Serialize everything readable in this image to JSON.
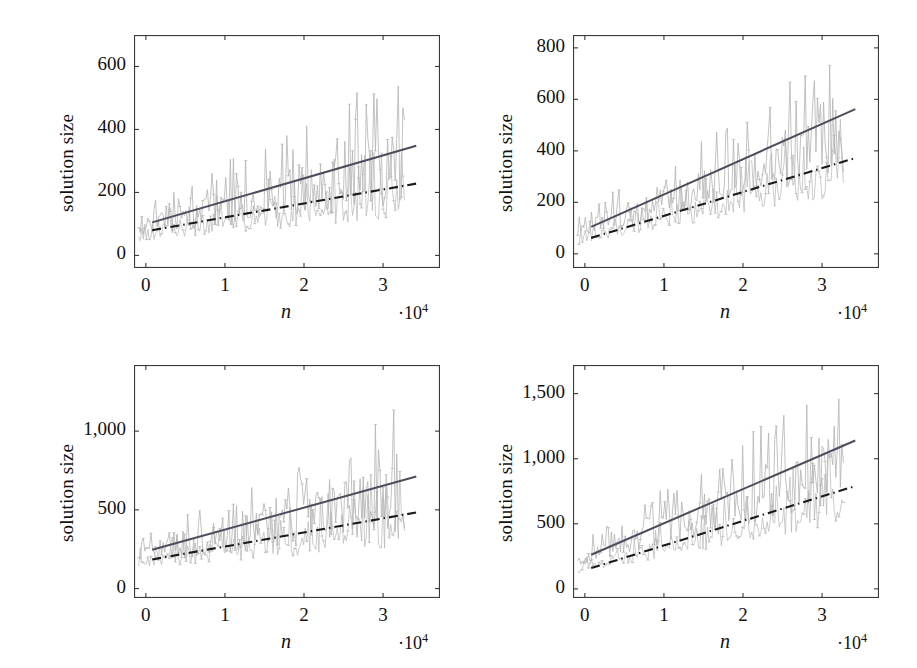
{
  "figure": {
    "background_color": "#ffffff",
    "panel_count": 4
  },
  "style": {
    "data_color": "#b3b3b3",
    "trend_solid_color": "#4d4d5c",
    "trend_dashdot_color": "#1a1a1a",
    "axis_color": "#3a3a3a",
    "text_color": "#111111"
  },
  "chart_data": [
    {
      "id": "panel-top-left",
      "type": "line",
      "title": "",
      "xlabel": "n",
      "xlabel_exponent": "·10",
      "xlabel_exponent_power": "4",
      "ylabel": "solution size",
      "xticks": [
        0,
        1,
        2,
        3
      ],
      "xtick_labels": [
        "0",
        "1",
        "2",
        "3"
      ],
      "yticks": [
        0,
        200,
        400,
        600
      ],
      "ytick_labels": [
        "0",
        "200",
        "400",
        "600"
      ],
      "xlim": [
        -0.15,
        3.72
      ],
      "ylim": [
        -40,
        700
      ],
      "grid": false,
      "legend": "none",
      "series": [
        {
          "name": "upper-trend-solid",
          "style": "solid",
          "color": "#4d4d5c",
          "x": [
            0.08,
            3.42
          ],
          "values": [
            105,
            348
          ]
        },
        {
          "name": "lower-trend-dashdot",
          "style": "dashdot",
          "color": "#1a1a1a",
          "x": [
            0.08,
            3.42
          ],
          "values": [
            80,
            228
          ]
        },
        {
          "name": "noisy-upper-samples",
          "style": "noisy",
          "color": "#b3b3b3",
          "mean_at_xmin": 95,
          "mean_at_xmax": 300,
          "noise_amplitude_min": 45,
          "noise_amplitude_max": 210,
          "seed": 11,
          "n_points": 175
        },
        {
          "name": "noisy-lower-samples",
          "style": "noisy",
          "color": "#b3b3b3",
          "mean_at_xmin": 70,
          "mean_at_xmax": 205,
          "noise_amplitude_min": 35,
          "noise_amplitude_max": 125,
          "seed": 29,
          "n_points": 175
        }
      ]
    },
    {
      "id": "panel-top-right",
      "type": "line",
      "title": "",
      "xlabel": "n",
      "xlabel_exponent": "·10",
      "xlabel_exponent_power": "4",
      "ylabel": "solution size",
      "xticks": [
        0,
        1,
        2,
        3
      ],
      "xtick_labels": [
        "0",
        "1",
        "2",
        "3"
      ],
      "yticks": [
        0,
        200,
        400,
        600,
        800
      ],
      "ytick_labels": [
        "0",
        "200",
        "400",
        "600",
        "800"
      ],
      "xlim": [
        -0.15,
        3.72
      ],
      "ylim": [
        -55,
        850
      ],
      "grid": false,
      "legend": "none",
      "series": [
        {
          "name": "upper-trend-solid",
          "style": "solid",
          "color": "#4d4d5c",
          "x": [
            0.08,
            3.42
          ],
          "values": [
            105,
            562
          ]
        },
        {
          "name": "lower-trend-dashdot",
          "style": "dashdot",
          "color": "#1a1a1a",
          "x": [
            0.08,
            3.42
          ],
          "values": [
            62,
            372
          ]
        },
        {
          "name": "noisy-upper-samples",
          "style": "noisy",
          "color": "#b3b3b3",
          "mean_at_xmin": 95,
          "mean_at_xmax": 470,
          "noise_amplitude_min": 45,
          "noise_amplitude_max": 235,
          "seed": 47,
          "n_points": 175
        },
        {
          "name": "noisy-lower-samples",
          "style": "noisy",
          "color": "#b3b3b3",
          "mean_at_xmin": 60,
          "mean_at_xmax": 330,
          "noise_amplitude_min": 35,
          "noise_amplitude_max": 150,
          "seed": 63,
          "n_points": 175
        }
      ]
    },
    {
      "id": "panel-bottom-left",
      "type": "line",
      "title": "",
      "xlabel": "n",
      "xlabel_exponent": "·10",
      "xlabel_exponent_power": "4",
      "ylabel": "solution size",
      "xticks": [
        0,
        1,
        2,
        3
      ],
      "xtick_labels": [
        "0",
        "1",
        "2",
        "3"
      ],
      "yticks": [
        0,
        500,
        1000
      ],
      "ytick_labels": [
        "0",
        "500",
        "1,000"
      ],
      "xlim": [
        -0.15,
        3.72
      ],
      "ylim": [
        -60,
        1420
      ],
      "grid": false,
      "legend": "none",
      "series": [
        {
          "name": "upper-trend-solid",
          "style": "solid",
          "color": "#4d4d5c",
          "x": [
            0.08,
            3.42
          ],
          "values": [
            246,
            712
          ]
        },
        {
          "name": "lower-trend-dashdot",
          "style": "dashdot",
          "color": "#1a1a1a",
          "x": [
            0.08,
            3.42
          ],
          "values": [
            185,
            483
          ]
        },
        {
          "name": "noisy-upper-samples",
          "style": "noisy",
          "color": "#b3b3b3",
          "mean_at_xmin": 215,
          "mean_at_xmax": 620,
          "noise_amplitude_min": 80,
          "noise_amplitude_max": 400,
          "seed": 83,
          "n_points": 175
        },
        {
          "name": "noisy-lower-samples",
          "style": "noisy",
          "color": "#b3b3b3",
          "mean_at_xmin": 170,
          "mean_at_xmax": 440,
          "noise_amplitude_min": 65,
          "noise_amplitude_max": 255,
          "seed": 97,
          "n_points": 175
        }
      ]
    },
    {
      "id": "panel-bottom-right",
      "type": "line",
      "title": "",
      "xlabel": "n",
      "xlabel_exponent": "·10",
      "xlabel_exponent_power": "4",
      "ylabel": "solution size",
      "xticks": [
        0,
        1,
        2,
        3
      ],
      "xtick_labels": [
        "0",
        "1",
        "2",
        "3"
      ],
      "yticks": [
        0,
        500,
        1000,
        1500
      ],
      "ytick_labels": [
        "0",
        "500",
        "1,000",
        "1,500"
      ],
      "xlim": [
        -0.15,
        3.72
      ],
      "ylim": [
        -70,
        1720
      ],
      "grid": false,
      "legend": "none",
      "series": [
        {
          "name": "upper-trend-solid",
          "style": "solid",
          "color": "#4d4d5c",
          "x": [
            0.08,
            3.42
          ],
          "values": [
            262,
            1140
          ]
        },
        {
          "name": "lower-trend-dashdot",
          "style": "dashdot",
          "color": "#1a1a1a",
          "x": [
            0.08,
            3.42
          ],
          "values": [
            160,
            790
          ]
        },
        {
          "name": "noisy-upper-samples",
          "style": "noisy",
          "color": "#b3b3b3",
          "mean_at_xmin": 225,
          "mean_at_xmax": 1010,
          "noise_amplitude_min": 85,
          "noise_amplitude_max": 480,
          "seed": 131,
          "n_points": 175
        },
        {
          "name": "noisy-lower-samples",
          "style": "noisy",
          "color": "#b3b3b3",
          "mean_at_xmin": 150,
          "mean_at_xmax": 700,
          "noise_amplitude_min": 60,
          "noise_amplitude_max": 300,
          "seed": 157,
          "n_points": 175
        }
      ]
    }
  ],
  "panels": [
    {
      "name": "panel-top-left",
      "left": 134,
      "top": 35,
      "width": 306,
      "height": 233,
      "ylabel_text": "solution size",
      "xlabel_text": "n",
      "exp_text_prefix": "·10",
      "exp_text_power": "4"
    },
    {
      "name": "panel-top-right",
      "left": 573,
      "top": 35,
      "width": 306,
      "height": 233,
      "ylabel_text": "solution size",
      "xlabel_text": "n",
      "exp_text_prefix": "·10",
      "exp_text_power": "4"
    },
    {
      "name": "panel-bottom-left",
      "left": 134,
      "top": 365,
      "width": 306,
      "height": 233,
      "ylabel_text": "solution size",
      "xlabel_text": "n",
      "exp_text_prefix": "·10",
      "exp_text_power": "4"
    },
    {
      "name": "panel-bottom-right",
      "left": 573,
      "top": 365,
      "width": 306,
      "height": 233,
      "ylabel_text": "solution size",
      "xlabel_text": "n",
      "exp_text_prefix": "·10",
      "exp_text_power": "4"
    }
  ]
}
